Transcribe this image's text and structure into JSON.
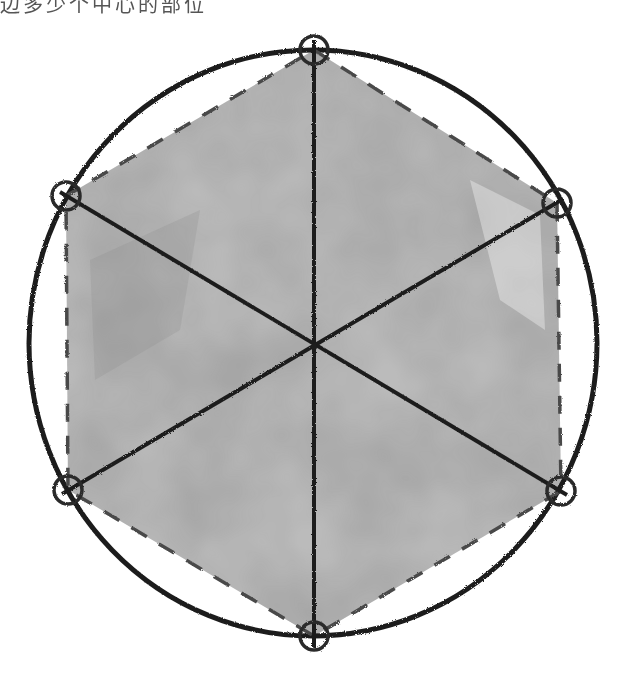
{
  "caption": {
    "text": "边多少个中心的部位"
  },
  "diagram": {
    "circle": {
      "cx": 313,
      "cy": 343,
      "rx": 284,
      "ry": 293,
      "stroke": "#1e1e1e"
    },
    "center": {
      "x": 314,
      "y": 347
    },
    "vertices": [
      {
        "name": "top",
        "x": 314,
        "y": 50
      },
      {
        "name": "upper-right",
        "x": 557,
        "y": 203
      },
      {
        "name": "lower-right",
        "x": 561,
        "y": 491
      },
      {
        "name": "bottom",
        "x": 314,
        "y": 636
      },
      {
        "name": "lower-left",
        "x": 68,
        "y": 490
      },
      {
        "name": "upper-left",
        "x": 66,
        "y": 196
      }
    ],
    "vertex_marker_radius": 14,
    "hexagon": {
      "style": "dashed",
      "stroke": "#4a4a4a",
      "fill": "#a9a9a9"
    },
    "diagonals": 3,
    "colors": {
      "line": "#1e1e1e",
      "shade": "#a9a9a9",
      "shade_dark": "#8f8f8f",
      "background": "#ffffff"
    }
  }
}
